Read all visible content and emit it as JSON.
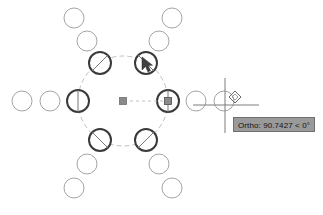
{
  "app": {
    "name": "CAD Drawing Canvas",
    "background_color": "#ffffff"
  },
  "tooltip": {
    "label": "Ortho: 90.7427 < 0°",
    "value": "90.7427",
    "angle": "0°",
    "mode": "Ortho",
    "background_color": "#9a9a9a",
    "border_color": "#6f6f6f",
    "text_color": "#111111"
  },
  "colors": {
    "selected_circle": "#3a3a3a",
    "ghost_circle": "#8d8d8d",
    "ring_path": "#9b9b9b",
    "grip_square": "#8a8a8a",
    "crosshair": "#7c7c7c",
    "snap_marker": "#6f6f6f",
    "cursor_arrow": "#444444"
  },
  "geometry": {
    "center": {
      "x": 123,
      "y": 101
    },
    "ring_radius": 45,
    "circle_radius": 11,
    "ghost_radius": 10,
    "array_type": "polar",
    "item_count": 6,
    "rows": 3
  },
  "array_items": [
    {
      "name": "item-left",
      "cx": 78,
      "cy": 101,
      "state": "selected",
      "angle_deg": 180
    },
    {
      "name": "item-upper-left",
      "cx": 100,
      "cy": 63,
      "state": "selected",
      "angle_deg": 120
    },
    {
      "name": "item-upper-right",
      "cx": 146,
      "cy": 63,
      "state": "selected",
      "angle_deg": 60
    },
    {
      "name": "item-right",
      "cx": 168,
      "cy": 101,
      "state": "selected",
      "angle_deg": 0
    },
    {
      "name": "item-lower-right",
      "cx": 146,
      "cy": 140,
      "state": "selected",
      "angle_deg": 300
    },
    {
      "name": "item-lower-left",
      "cx": 100,
      "cy": 140,
      "state": "selected",
      "angle_deg": 240
    }
  ],
  "ghost_items": [
    {
      "name": "ghost-left-row2",
      "cx": 50,
      "cy": 101
    },
    {
      "name": "ghost-left-row3",
      "cx": 22,
      "cy": 101
    },
    {
      "name": "ghost-right-row2",
      "cx": 196,
      "cy": 101
    },
    {
      "name": "ghost-right-row3",
      "cx": 224,
      "cy": 101
    },
    {
      "name": "ghost-upper-left-row2",
      "cx": 87,
      "cy": 41
    },
    {
      "name": "ghost-upper-left-row3",
      "cx": 74,
      "cy": 18
    },
    {
      "name": "ghost-upper-right-row2",
      "cx": 159,
      "cy": 41
    },
    {
      "name": "ghost-upper-right-row3",
      "cx": 172,
      "cy": 18
    },
    {
      "name": "ghost-lower-left-row2",
      "cx": 87,
      "cy": 164
    },
    {
      "name": "ghost-lower-left-row3",
      "cx": 74,
      "cy": 188
    },
    {
      "name": "ghost-lower-right-row2",
      "cx": 159,
      "cy": 164
    },
    {
      "name": "ghost-lower-right-row3",
      "cx": 172,
      "cy": 188
    }
  ],
  "grips": [
    {
      "name": "base-point-grip",
      "cx": 123,
      "cy": 101,
      "shape": "square",
      "size": 7
    },
    {
      "name": "row-count-grip",
      "cx": 168,
      "cy": 101,
      "shape": "square",
      "size": 7
    }
  ],
  "cursor": {
    "arrow": {
      "name": "mouse-pointer",
      "x": 146,
      "y": 61
    },
    "crosshair": {
      "name": "crosshair-cursor",
      "x": 225,
      "y": 101,
      "h_len": 33,
      "v_len": 53
    },
    "snap_marker": {
      "name": "nearest-osnap-marker",
      "cx": 235,
      "cy": 97,
      "size": 8
    }
  },
  "stretch_line": {
    "name": "stretch-guide-line",
    "from_x": 123,
    "from_y": 101,
    "to_x": 166,
    "to_y": 101
  }
}
